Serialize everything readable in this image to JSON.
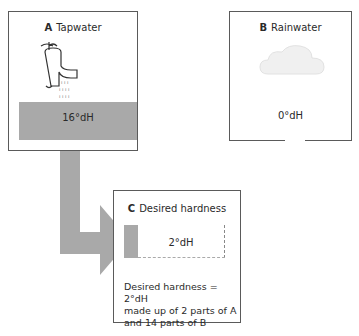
{
  "boxes": {
    "a": {
      "letter": "A",
      "label": "Tapwater",
      "value": "16°dH",
      "icon": "tap-icon"
    },
    "b": {
      "letter": "B",
      "label": "Rainwater",
      "value": "0°dH",
      "icon": "cloud-icon"
    },
    "c": {
      "letter": "C",
      "label": "Desired hardness",
      "value": "2°dH",
      "description": [
        "Desired hardness = 2°dH",
        "made up of 2 parts of A",
        "and 14 parts of B"
      ]
    }
  },
  "colors": {
    "flow": "#a9a9a9",
    "border": "#5a5a5a"
  }
}
